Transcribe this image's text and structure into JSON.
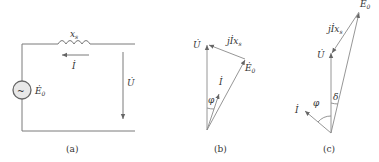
{
  "figure": {
    "panel_a": {
      "caption": "(a)",
      "inductor_label": "x",
      "inductor_sub": "s",
      "current_label": "İ",
      "voltage_label": "U̇",
      "source_label": "Ė",
      "source_sub": "0",
      "source_symbol": "~"
    },
    "panel_b": {
      "caption": "(b)",
      "u_label": "U̇",
      "jix_label": "jİx",
      "jix_sub": "s",
      "e_label": "Ė",
      "e_sub": "0",
      "i_label": "İ",
      "phi_label": "φ"
    },
    "panel_c": {
      "caption": "(c)",
      "u_label": "U̇",
      "jix_label": "jİx",
      "jix_sub": "s",
      "e_label": "Ė",
      "e_sub": "0",
      "i_label": "İ",
      "phi_label": "φ",
      "delta_label": "δ"
    }
  }
}
